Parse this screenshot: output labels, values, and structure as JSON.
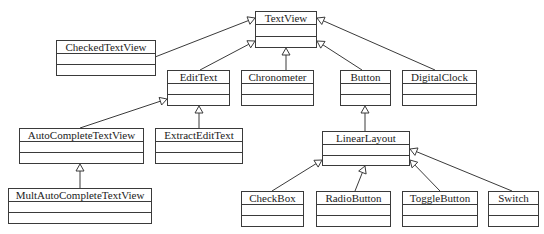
{
  "diagram": {
    "type": "uml-class-inheritance",
    "classes": [
      {
        "id": "TextView",
        "label": "TextView",
        "x": 255,
        "y": 11,
        "w": 62,
        "h": 37
      },
      {
        "id": "CheckedTextView",
        "label": "CheckedTextView",
        "x": 56,
        "y": 40,
        "w": 100,
        "h": 36
      },
      {
        "id": "EditText",
        "label": "EditText",
        "x": 167,
        "y": 70,
        "w": 63,
        "h": 36
      },
      {
        "id": "Chronometer",
        "label": "Chronometer",
        "x": 241,
        "y": 70,
        "w": 73,
        "h": 36
      },
      {
        "id": "Button",
        "label": "Button",
        "x": 340,
        "y": 70,
        "w": 51,
        "h": 36
      },
      {
        "id": "DigitalClock",
        "label": "DigitalClock",
        "x": 402,
        "y": 70,
        "w": 75,
        "h": 36
      },
      {
        "id": "AutoCompleteTextView",
        "label": "AutoCompleteTextView",
        "x": 19,
        "y": 128,
        "w": 125,
        "h": 36
      },
      {
        "id": "ExtractEditText",
        "label": "ExtractEditText",
        "x": 155,
        "y": 128,
        "w": 88,
        "h": 36
      },
      {
        "id": "LinearLayout",
        "label": "LinearLayout",
        "x": 322,
        "y": 131,
        "w": 88,
        "h": 35
      },
      {
        "id": "MultAutoCompleteTextView",
        "label": "MultAutoCompleteTextView",
        "x": 8,
        "y": 188,
        "w": 144,
        "h": 36
      },
      {
        "id": "CheckBox",
        "label": "CheckBox",
        "x": 241,
        "y": 191,
        "w": 63,
        "h": 36
      },
      {
        "id": "RadioButton",
        "label": "RadioButton",
        "x": 316,
        "y": 191,
        "w": 75,
        "h": 36
      },
      {
        "id": "ToggleButton",
        "label": "ToggleButton",
        "x": 402,
        "y": 191,
        "w": 76,
        "h": 36
      },
      {
        "id": "Switch",
        "label": "Switch",
        "x": 488,
        "y": 191,
        "w": 51,
        "h": 36
      }
    ],
    "edges": [
      {
        "from": "CheckedTextView",
        "to": "TextView",
        "x1": 155,
        "y1": 57,
        "x2": 255,
        "y2": 18
      },
      {
        "from": "EditText",
        "to": "TextView",
        "x1": 200,
        "y1": 70,
        "x2": 255,
        "y2": 41
      },
      {
        "from": "Chronometer",
        "to": "TextView",
        "x1": 286,
        "y1": 70,
        "x2": 286,
        "y2": 48
      },
      {
        "from": "Button",
        "to": "TextView",
        "x1": 362,
        "y1": 70,
        "x2": 317,
        "y2": 41
      },
      {
        "from": "DigitalClock",
        "to": "TextView",
        "x1": 435,
        "y1": 70,
        "x2": 317,
        "y2": 18
      },
      {
        "from": "AutoCompleteTextView",
        "to": "EditText",
        "x1": 80,
        "y1": 128,
        "x2": 167,
        "y2": 99
      },
      {
        "from": "ExtractEditText",
        "to": "EditText",
        "x1": 199,
        "y1": 128,
        "x2": 199,
        "y2": 106
      },
      {
        "from": "MultAutoCompleteTextView",
        "to": "AutoCompleteTextView",
        "x1": 80,
        "y1": 188,
        "x2": 80,
        "y2": 164
      },
      {
        "from": "LinearLayout",
        "to": "Button",
        "x1": 365,
        "y1": 131,
        "x2": 365,
        "y2": 106
      },
      {
        "from": "CheckBox",
        "to": "LinearLayout",
        "x1": 272,
        "y1": 191,
        "x2": 322,
        "y2": 160
      },
      {
        "from": "RadioButton",
        "to": "LinearLayout",
        "x1": 355,
        "y1": 191,
        "x2": 365,
        "y2": 166
      },
      {
        "from": "ToggleButton",
        "to": "LinearLayout",
        "x1": 440,
        "y1": 191,
        "x2": 410,
        "y2": 160
      },
      {
        "from": "Switch",
        "to": "LinearLayout",
        "x1": 512,
        "y1": 191,
        "x2": 410,
        "y2": 149
      }
    ],
    "colors": {
      "line": "#3a3a3a",
      "background": "#ffffff",
      "text": "#222222"
    }
  }
}
